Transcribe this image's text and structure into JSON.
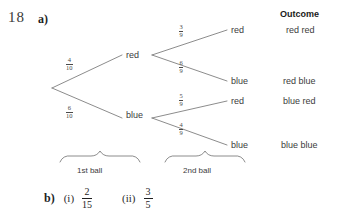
{
  "question": {
    "number": "18",
    "part_a_label": "a)",
    "part_b_label": "b)"
  },
  "tree": {
    "stage1": {
      "brace_label": "1st ball",
      "branches": [
        {
          "node": "red",
          "probability_numerator": "4",
          "probability_denominator": "10"
        },
        {
          "node": "blue",
          "probability_numerator": "6",
          "probability_denominator": "10"
        }
      ]
    },
    "stage2": {
      "brace_label": "2nd ball",
      "branches": [
        {
          "parent": "red",
          "node": "red",
          "probability_numerator": "3",
          "probability_denominator": "9"
        },
        {
          "parent": "red",
          "node": "blue",
          "probability_numerator": "6",
          "probability_denominator": "9"
        },
        {
          "parent": "blue",
          "node": "red",
          "probability_numerator": "5",
          "probability_denominator": "9"
        },
        {
          "parent": "blue",
          "node": "blue",
          "probability_numerator": "4",
          "probability_denominator": "9"
        }
      ]
    }
  },
  "outcomes": {
    "heading": "Outcome",
    "items": [
      "red red",
      "red blue",
      "blue red",
      "blue blue"
    ]
  },
  "answers": [
    {
      "roman": "(i)",
      "numerator": "2",
      "denominator": "15"
    },
    {
      "roman": "(ii)",
      "numerator": "3",
      "denominator": "5"
    }
  ],
  "colors": {
    "ink": "#3c3c3c",
    "heading_ink": "#1a1a1a",
    "line": "#6e6e6e",
    "background": "#ffffff"
  }
}
